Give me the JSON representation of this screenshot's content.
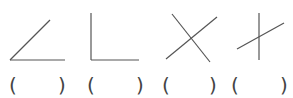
{
  "figures": [
    {
      "name": "acute-angle",
      "lines": [
        [
          10,
          60,
          50,
          20
        ],
        [
          10,
          60,
          65,
          60
        ]
      ]
    },
    {
      "name": "right-angle",
      "lines": [
        [
          91,
          13,
          91,
          60
        ],
        [
          91,
          60,
          139,
          60
        ]
      ]
    },
    {
      "name": "intersecting-lines-x",
      "lines": [
        [
          172,
          14,
          210,
          62
        ],
        [
          166,
          59,
          217,
          17
        ]
      ]
    },
    {
      "name": "intersecting-lines-cross",
      "lines": [
        [
          259,
          13,
          259,
          60
        ],
        [
          237,
          49,
          284,
          23
        ]
      ]
    }
  ],
  "answer_blanks": [
    {
      "open": "(",
      "close": ")"
    },
    {
      "open": "(",
      "close": ")"
    },
    {
      "open": "(",
      "close": ")"
    },
    {
      "open": "(",
      "close": ")"
    }
  ],
  "colors": {
    "stroke": "#555555"
  }
}
